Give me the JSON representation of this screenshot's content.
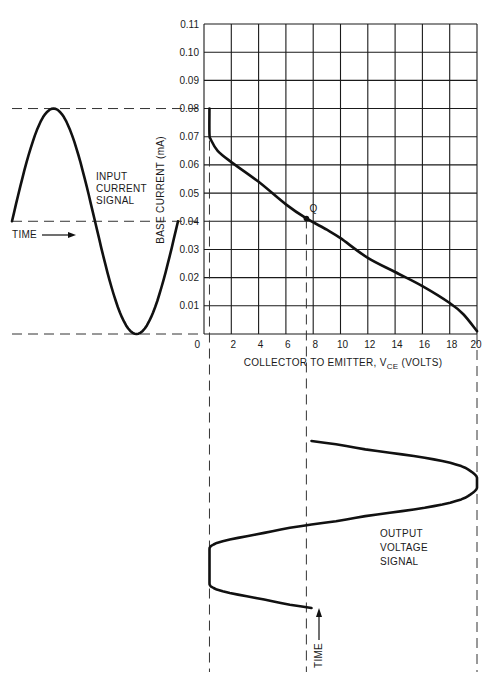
{
  "chart_data": {
    "type": "line",
    "title": "",
    "xlabel": "COLLECTOR TO EMITTER, V",
    "xlabel_sub": "CE",
    "xlabel_unit": " (VOLTS)",
    "ylabel": "BASE CURRENT (mA)",
    "xlim": [
      0,
      20
    ],
    "ylim": [
      0,
      0.11
    ],
    "x_ticks": [
      "0",
      "2",
      "4",
      "6",
      "8",
      "10",
      "12",
      "14",
      "16",
      "18",
      "20"
    ],
    "y_ticks": [
      "0.01",
      "0.02",
      "0.03",
      "0.04",
      "0.05",
      "0.06",
      "0.07",
      "0.08",
      "0.09",
      "0.10",
      "0.11"
    ],
    "grid": true,
    "load_line": {
      "name": "operating curve",
      "x": [
        0.4,
        0.4,
        0.5,
        1.0,
        2.0,
        4.0,
        6.0,
        7.5,
        9.0,
        10.0,
        12.0,
        14.0,
        16.0,
        18.0,
        19.0,
        20.0
      ],
      "y": [
        0.08,
        0.071,
        0.069,
        0.065,
        0.061,
        0.054,
        0.046,
        0.041,
        0.037,
        0.034,
        0.027,
        0.022,
        0.017,
        0.011,
        0.007,
        0.001
      ]
    },
    "q_point": {
      "label": "Q",
      "x": 7.5,
      "y": 0.041
    },
    "input_signal": {
      "label_lines": [
        "INPUT",
        "CURRENT",
        "SIGNAL"
      ],
      "time_label": "TIME",
      "center_mA": 0.04,
      "peak_mA": 0.08,
      "trough_mA": 0.0
    },
    "output_signal": {
      "label_lines": [
        "OUTPUT",
        "VOLTAGE",
        "SIGNAL"
      ],
      "time_label": "TIME",
      "center_V": 7.5,
      "max_V": 20,
      "min_V": 0.4
    }
  }
}
